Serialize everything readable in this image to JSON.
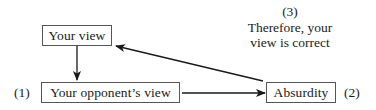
{
  "diagram": {
    "nodes": {
      "your_view": {
        "label": "Your view"
      },
      "opponent_view": {
        "label": "Your opponent’s view",
        "step": "(1)"
      },
      "absurdity": {
        "label": "Absurdity",
        "step": "(2)"
      }
    },
    "conclusion": {
      "step": "(3)",
      "line1": "Therefore, your",
      "line2": "view is correct"
    },
    "edges": [
      {
        "from": "Your view",
        "to": "Your opponent’s view"
      },
      {
        "from": "Your opponent’s view",
        "to": "Absurdity"
      },
      {
        "from": "Absurdity",
        "to": "Your view"
      }
    ],
    "colors": {
      "line": "#1a1a1a",
      "box_border": "#555555"
    }
  }
}
